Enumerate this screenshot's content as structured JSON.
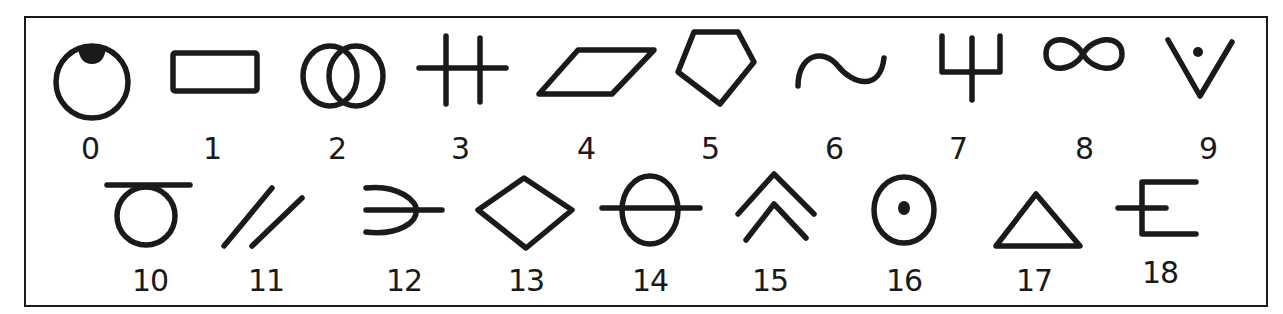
{
  "symbols": [
    {
      "number": "0",
      "name": "circle-with-filled-top-cap"
    },
    {
      "number": "1",
      "name": "rectangle"
    },
    {
      "number": "2",
      "name": "interlocking-circles"
    },
    {
      "number": "3",
      "name": "double-vertical-cross"
    },
    {
      "number": "4",
      "name": "parallelogram"
    },
    {
      "number": "5",
      "name": "pentagon"
    },
    {
      "number": "6",
      "name": "wave"
    },
    {
      "number": "7",
      "name": "trident"
    },
    {
      "number": "8",
      "name": "infinity"
    },
    {
      "number": "9",
      "name": "v-with-dot"
    },
    {
      "number": "10",
      "name": "circle-with-top-bar"
    },
    {
      "number": "11",
      "name": "double-slash"
    },
    {
      "number": "12",
      "name": "open-curve-with-line"
    },
    {
      "number": "13",
      "name": "diamond"
    },
    {
      "number": "14",
      "name": "circle-with-horizontal-line"
    },
    {
      "number": "15",
      "name": "double-chevron-up"
    },
    {
      "number": "16",
      "name": "circle-with-center-dot"
    },
    {
      "number": "17",
      "name": "triangle"
    },
    {
      "number": "18",
      "name": "e-shape-with-tail"
    }
  ],
  "colors": {
    "ink": "#1a1a1a",
    "background": "#ffffff"
  }
}
